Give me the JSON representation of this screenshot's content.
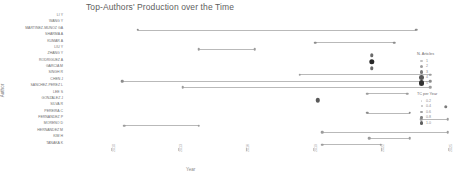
{
  "chart": {
    "title": "Top-Authors' Production over the Time",
    "xlabel": "Year",
    "ylabel": "Author"
  },
  "chart_data": {
    "type": "scatter",
    "title": "Top-Authors' Production over the Time",
    "xlabel": "Year",
    "ylabel": "Author",
    "xlim": [
      2008,
      2023
    ],
    "grid": false,
    "legend_position": "right",
    "x_ticks": [
      2010,
      2013,
      2016,
      2019,
      2022,
      2025
    ],
    "authors": [
      "LI Y",
      "WANG Y",
      "MARTINEZ-MUNOZ GA",
      "SHARMA A",
      "KUMAR A",
      "LIU Y",
      "ZHANG Y",
      "RODRIGUEZ A",
      "GARCIA M",
      "SINGH R",
      "CHEN J",
      "SANCHEZ-PEREZ L",
      "LEE S",
      "GONZALEZ J",
      "SILVA R",
      "PEREIRA C",
      "FERNANDEZ P",
      "MORENO D",
      "HERNANDEZ M",
      "KIM H",
      "TANAKA K"
    ],
    "series": [
      {
        "author": "LI Y",
        "row": 0,
        "start": null,
        "end": null,
        "points": []
      },
      {
        "author": "WANG Y",
        "row": 1,
        "start": null,
        "end": null,
        "points": []
      },
      {
        "author": "MARTINEZ-MUNOZ GA",
        "row": 2,
        "start": 2011.2,
        "end": 2023.6,
        "points": [
          {
            "x": 2011.2,
            "articles": 1,
            "tc_per_year": 0.4
          },
          {
            "x": 2023.6,
            "articles": 1,
            "tc_per_year": 0.4
          }
        ]
      },
      {
        "author": "SHARMA A",
        "row": 3,
        "start": null,
        "end": null,
        "points": []
      },
      {
        "author": "KUMAR A",
        "row": 4,
        "start": 2019.1,
        "end": 2022.6,
        "points": [
          {
            "x": 2019.1,
            "articles": 1,
            "tc_per_year": 0.4
          },
          {
            "x": 2022.6,
            "articles": 1,
            "tc_per_year": 0.4
          }
        ]
      },
      {
        "author": "LIU Y",
        "row": 5,
        "start": 2013.9,
        "end": 2016.4,
        "points": [
          {
            "x": 2013.9,
            "articles": 1,
            "tc_per_year": 0.3
          },
          {
            "x": 2016.4,
            "articles": 1,
            "tc_per_year": 0.3
          }
        ]
      },
      {
        "author": "ZHANG Y",
        "row": 6,
        "start": null,
        "end": null,
        "points": [
          {
            "x": 2021.6,
            "articles": 2,
            "tc_per_year": 0.6
          }
        ]
      },
      {
        "author": "RODRIGUEZ A",
        "row": 7,
        "start": null,
        "end": null,
        "points": [
          {
            "x": 2021.6,
            "articles": 4,
            "tc_per_year": 1.0
          }
        ]
      },
      {
        "author": "GARCIA M",
        "row": 8,
        "start": null,
        "end": null,
        "points": [
          {
            "x": 2021.6,
            "articles": 2,
            "tc_per_year": 0.6
          }
        ]
      },
      {
        "author": "SINGH R",
        "row": 9,
        "start": 2018.4,
        "end": 2024.2,
        "points": [
          {
            "x": 2018.4,
            "articles": 1,
            "tc_per_year": 0.3
          },
          {
            "x": 2024.2,
            "articles": 1,
            "tc_per_year": 0.3
          }
        ]
      },
      {
        "author": "CHEN J",
        "row": 10,
        "start": 2010.5,
        "end": 2024.2,
        "points": [
          {
            "x": 2010.5,
            "articles": 1,
            "tc_per_year": 0.4
          },
          {
            "x": 2024.2,
            "articles": 1,
            "tc_per_year": 0.4
          }
        ]
      },
      {
        "author": "SANCHEZ-PEREZ L",
        "row": 11,
        "start": 2013.2,
        "end": 2024.2,
        "points": [
          {
            "x": 2013.2,
            "articles": 1,
            "tc_per_year": 0.3
          },
          {
            "x": 2024.2,
            "articles": 1,
            "tc_per_year": 0.3
          }
        ]
      },
      {
        "author": "LEE S",
        "row": 12,
        "start": 2021.4,
        "end": 2023.2,
        "points": [
          {
            "x": 2021.4,
            "articles": 1,
            "tc_per_year": 0.3
          },
          {
            "x": 2023.2,
            "articles": 1,
            "tc_per_year": 0.3
          }
        ]
      },
      {
        "author": "GONZALEZ J",
        "row": 13,
        "start": null,
        "end": null,
        "points": [
          {
            "x": 2019.2,
            "articles": 3,
            "tc_per_year": 0.7
          }
        ]
      },
      {
        "author": "SILVA R",
        "row": 14,
        "start": null,
        "end": null,
        "points": [
          {
            "x": 2024.9,
            "articles": 2,
            "tc_per_year": 0.5
          }
        ]
      },
      {
        "author": "PEREIRA C",
        "row": 15,
        "start": 2021.4,
        "end": 2023.3,
        "points": [
          {
            "x": 2021.4,
            "articles": 1,
            "tc_per_year": 0.4
          },
          {
            "x": 2023.3,
            "articles": 1,
            "tc_per_year": 0.4
          }
        ]
      },
      {
        "author": "FERNANDEZ P",
        "row": 16,
        "start": 2023.8,
        "end": 2025.0,
        "points": [
          {
            "x": 2023.8,
            "articles": 1,
            "tc_per_year": 0.3
          },
          {
            "x": 2025.0,
            "articles": 1,
            "tc_per_year": 0.3
          }
        ]
      },
      {
        "author": "MORENO D",
        "row": 17,
        "start": 2010.6,
        "end": 2013.9,
        "points": [
          {
            "x": 2010.6,
            "articles": 1,
            "tc_per_year": 0.3
          },
          {
            "x": 2013.9,
            "articles": 1,
            "tc_per_year": 0.3
          }
        ]
      },
      {
        "author": "HERNANDEZ M",
        "row": 18,
        "start": 2019.4,
        "end": 2025.0,
        "points": [
          {
            "x": 2019.4,
            "articles": 1,
            "tc_per_year": 0.3
          },
          {
            "x": 2025.0,
            "articles": 1,
            "tc_per_year": 0.3
          }
        ]
      },
      {
        "author": "KIM H",
        "row": 19,
        "start": 2021.5,
        "end": 2023.3,
        "points": [
          {
            "x": 2021.5,
            "articles": 1,
            "tc_per_year": 0.3
          },
          {
            "x": 2023.3,
            "articles": 1,
            "tc_per_year": 0.3
          }
        ]
      },
      {
        "author": "TANAKA K",
        "row": 20,
        "start": 2019.4,
        "end": 2022.0,
        "points": [
          {
            "x": 2019.4,
            "articles": 1,
            "tc_per_year": 0.3
          },
          {
            "x": 2022.0,
            "articles": 1,
            "tc_per_year": 0.3
          }
        ]
      }
    ]
  },
  "legends": [
    {
      "title": "N. Articles",
      "entries": [
        {
          "label": "1",
          "size": 2.2,
          "shade": "#c2c2c2"
        },
        {
          "label": "2",
          "size": 3.0,
          "shade": "#9e9e9e"
        },
        {
          "label": "3",
          "size": 3.8,
          "shade": "#7a7a7a"
        },
        {
          "label": "4",
          "size": 4.6,
          "shade": "#575757"
        },
        {
          "label": "5",
          "size": 5.4,
          "shade": "#333333"
        }
      ]
    },
    {
      "title": "TC per Year",
      "entries": [
        {
          "label": "0.2",
          "size": 1.6,
          "shade": "#d6d6d6"
        },
        {
          "label": "0.4",
          "size": 2.0,
          "shade": "#bdbdbd"
        },
        {
          "label": "0.6",
          "size": 2.4,
          "shade": "#a0a0a0"
        },
        {
          "label": "0.8",
          "size": 2.8,
          "shade": "#808080"
        },
        {
          "label": "1.0",
          "size": 3.2,
          "shade": "#5e5e5e"
        }
      ]
    }
  ]
}
